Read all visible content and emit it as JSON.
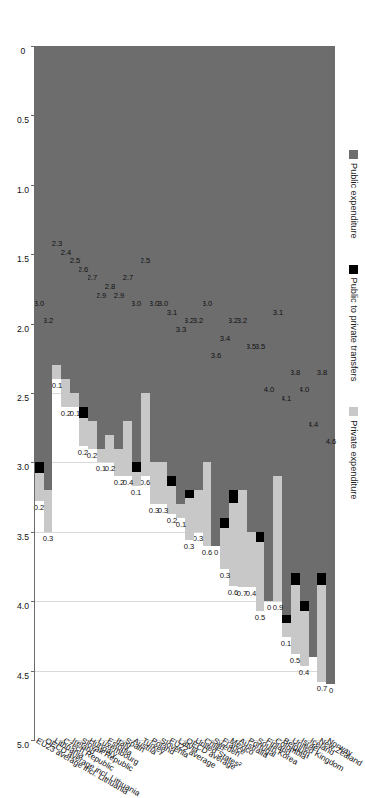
{
  "legend": {
    "position": "top-left",
    "items": [
      {
        "label": "Public expenditure",
        "color": "#6d6d6d",
        "key": "public"
      },
      {
        "label": "Public to private transfers",
        "color": "#000000",
        "key": "transfers"
      },
      {
        "label": "Private expenditure",
        "color": "#c8c8c8",
        "key": "private"
      }
    ]
  },
  "axis": {
    "ticks": [
      "0",
      "0.5",
      "1.0",
      "1.5",
      "2.0",
      "2.5",
      "3.0",
      "3.5",
      "4.0",
      "4.5",
      "5.0"
    ],
    "min": 0,
    "max": 5.0,
    "step": 0.5
  },
  "chart_data": {
    "type": "bar",
    "orientation": "horizontal-stacked",
    "title": "",
    "xlabel": "",
    "ylabel": "",
    "xlim": [
      0,
      5.0
    ],
    "grid": true,
    "legend_position": "top-left",
    "series": [
      {
        "name": "Public expenditure",
        "color": "#6d6d6d"
      },
      {
        "name": "Public to private transfers",
        "color": "#000000"
      },
      {
        "name": "Private expenditure",
        "color": "#c8c8c8"
      }
    ],
    "categories": [
      "Norway",
      "New Zealand",
      "Iceland",
      "Israel",
      "United Kingdom",
      "Belgium",
      "Colombia¹",
      "Finland",
      "South Korea",
      "Portugal",
      "Australia",
      "Mexico",
      "France",
      "Sweden",
      "Chile¹",
      "United States²",
      "OECD average",
      "Latvia",
      "EU22 average",
      "Slovenia",
      "Poland",
      "Turkey",
      "Austria",
      "Spain",
      "Italy",
      "Estonia",
      "Luxembourg",
      "Hungary",
      "Slovak Republic",
      "Ireland",
      "Czech Republic",
      "Lithuania",
      "OECD average incl. Lithuania",
      "EU23 average incl. Lithuania"
    ],
    "rows": [
      {
        "category": "Norway",
        "public": 4.6,
        "transfers": 0.0,
        "private": 0.0,
        "public_label": "4.6",
        "private_label": "0"
      },
      {
        "category": "New Zealand",
        "public": 3.8,
        "transfers": 0.08,
        "private": 0.7,
        "public_label": "3.8",
        "private_label": "0.7"
      },
      {
        "category": "Iceland",
        "public": 4.4,
        "transfers": 0.0,
        "private": 0.0,
        "public_label": "4.4",
        "private_label": ""
      },
      {
        "category": "Israel",
        "public": 4.0,
        "transfers": 0.07,
        "private": 0.4,
        "public_label": "4.0",
        "private_label": "0.4"
      },
      {
        "category": "United Kingdom",
        "public": 3.8,
        "transfers": 0.08,
        "private": 0.5,
        "public_label": "3.8",
        "private_label": "0.5"
      },
      {
        "category": "Belgium",
        "public": 4.1,
        "transfers": 0.06,
        "private": 0.1,
        "public_label": "4.1",
        "private_label": "0.1"
      },
      {
        "category": "Colombia¹",
        "public": 3.1,
        "transfers": 0.0,
        "private": 0.9,
        "public_label": "3.1",
        "private_label": "0.9"
      },
      {
        "category": "Finland",
        "public": 4.0,
        "transfers": 0.0,
        "private": 0.0,
        "public_label": "4.0",
        "private_label": "0"
      },
      {
        "category": "South Korea",
        "public": 3.5,
        "transfers": 0.07,
        "private": 0.5,
        "public_label": "3.5",
        "private_label": "0.5"
      },
      {
        "category": "Portugal",
        "public": 3.5,
        "transfers": 0.0,
        "private": 0.4,
        "public_label": "3.5",
        "private_label": "0.4"
      },
      {
        "category": "Australia",
        "public": 3.2,
        "transfers": 0.0,
        "private": 0.7,
        "public_label": "3.2",
        "private_label": "0.7"
      },
      {
        "category": "Mexico",
        "public": 3.2,
        "transfers": 0.09,
        "private": 0.6,
        "public_label": "3.2",
        "private_label": "0.6"
      },
      {
        "category": "France",
        "public": 3.4,
        "transfers": 0.07,
        "private": 0.3,
        "public_label": "3.4",
        "private_label": "0.3"
      },
      {
        "category": "Sweden",
        "public": 3.6,
        "transfers": 0.0,
        "private": 0.0,
        "public_label": "3.6",
        "private_label": "0"
      },
      {
        "category": "Chile¹",
        "public": 3.0,
        "transfers": 0.0,
        "private": 0.6,
        "public_label": "3.0",
        "private_label": "0.6"
      },
      {
        "category": "United States²",
        "public": 3.2,
        "transfers": 0.0,
        "private": 0.3,
        "public_label": "3.2",
        "private_label": "0.3"
      },
      {
        "category": "OECD average",
        "public": 3.2,
        "transfers": 0.06,
        "private": 0.3,
        "public_label": "3.2",
        "private_label": "0.3"
      },
      {
        "category": "Latvia",
        "public": 3.3,
        "transfers": 0.0,
        "private": 0.1,
        "public_label": "3.3",
        "private_label": "0.1"
      },
      {
        "category": "EU22 average",
        "public": 3.1,
        "transfers": 0.07,
        "private": 0.2,
        "public_label": "3.1",
        "private_label": "0.2"
      },
      {
        "category": "Slovenia",
        "public": 3.0,
        "transfers": 0.0,
        "private": 0.3,
        "public_label": "3.0",
        "private_label": "0.3"
      },
      {
        "category": "Poland",
        "public": 3.0,
        "transfers": 0.0,
        "private": 0.3,
        "public_label": "3.0",
        "private_label": "0.3"
      },
      {
        "category": "Turkey",
        "public": 2.5,
        "transfers": 0.0,
        "private": 0.6,
        "public_label": "2.5",
        "private_label": "0.6"
      },
      {
        "category": "Austria",
        "public": 3.0,
        "transfers": 0.07,
        "private": 0.1,
        "public_label": "3.0",
        "private_label": "0.1"
      },
      {
        "category": "Spain",
        "public": 2.7,
        "transfers": 0.0,
        "private": 0.4,
        "public_label": "2.7",
        "private_label": "0.4"
      },
      {
        "category": "Italy",
        "public": 2.9,
        "transfers": 0.0,
        "private": 0.2,
        "public_label": "2.9",
        "private_label": "0.2"
      },
      {
        "category": "Estonia",
        "public": 2.8,
        "transfers": 0.0,
        "private": 0.2,
        "public_label": "2.8",
        "private_label": "0.2"
      },
      {
        "category": "Luxembourg",
        "public": 2.9,
        "transfers": 0.0,
        "private": 0.1,
        "public_label": "2.9",
        "private_label": "0.1"
      },
      {
        "category": "Hungary",
        "public": 2.7,
        "transfers": 0.0,
        "private": 0.2,
        "public_label": "2.7",
        "private_label": "0.2"
      },
      {
        "category": "Slovak Republic",
        "public": 2.6,
        "transfers": 0.08,
        "private": 0.2,
        "public_label": "2.6",
        "private_label": "0.2"
      },
      {
        "category": "Ireland",
        "public": 2.5,
        "transfers": 0.0,
        "private": 0.1,
        "public_label": "2.5",
        "private_label": "0.1"
      },
      {
        "category": "Czech Republic",
        "public": 2.4,
        "transfers": 0.0,
        "private": 0.2,
        "public_label": "2.4",
        "private_label": "0.2"
      },
      {
        "category": "Lithuania",
        "public": 2.3,
        "transfers": 0.0,
        "private": 0.1,
        "public_label": "2.3",
        "private_label": "0.1"
      },
      {
        "category": "OECD average incl. Lithuania",
        "public": 3.2,
        "transfers": 0.0,
        "private": 0.3,
        "public_label": "3.2",
        "private_label": "0.3"
      },
      {
        "category": "EU23 average incl. Lithuania",
        "public": 3.0,
        "transfers": 0.08,
        "private": 0.2,
        "public_label": "3.0",
        "private_label": "0.2"
      }
    ]
  }
}
